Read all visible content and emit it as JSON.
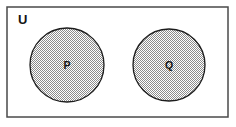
{
  "diagram": {
    "kind": "venn-diagram",
    "canvas": {
      "width": 236,
      "height": 127,
      "background_color": "#ffffff"
    },
    "universe": {
      "label": "U",
      "label_x": 18,
      "label_y": 24,
      "rect": {
        "x": 7,
        "y": 7,
        "width": 221,
        "height": 110
      },
      "stroke_color": "#4a4a4a",
      "stroke_width": 1.5,
      "fill_color": "#ffffff"
    },
    "sets": [
      {
        "label": "P",
        "cx": 67,
        "cy": 65,
        "r": 37,
        "fill_pattern": "checker-gray-50",
        "fill_color": "#d2d2d2",
        "stroke_color": "#1c1c1c",
        "stroke_width": 1.3
      },
      {
        "label": "Q",
        "cx": 169,
        "cy": 65,
        "r": 36,
        "fill_pattern": "checker-gray-50",
        "fill_color": "#d2d2d2",
        "stroke_color": "#1c1c1c",
        "stroke_width": 1.3
      }
    ],
    "relationship": "disjoint"
  }
}
